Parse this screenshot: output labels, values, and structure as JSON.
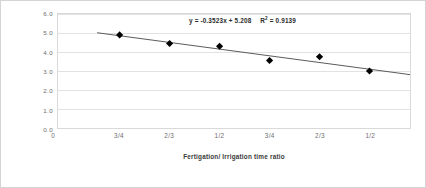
{
  "chart_data": {
    "type": "scatter",
    "title": "",
    "subtitle": "",
    "xlabel": "Fertigation/ Irrigation time ratio",
    "ylabel": "Yield   ton/fed",
    "x": [
      1,
      2,
      3,
      4,
      5,
      6
    ],
    "categories": [
      "3/4",
      "2/3",
      "1/2",
      "3/4",
      "2/3",
      "1/2"
    ],
    "values": [
      4.9,
      4.45,
      4.3,
      3.55,
      3.75,
      3.0
    ],
    "series": [
      {
        "name": "Yield",
        "values": [
          4.9,
          4.45,
          4.3,
          3.55,
          3.75,
          3.0
        ],
        "marker": "diamond",
        "color": "#000000"
      }
    ],
    "trendline": {
      "type": "linear",
      "slope": -0.3523,
      "intercept": 5.208,
      "r_squared": 0.9139,
      "equation_label": "y = -0.3523x + 5.208",
      "r2_label_prefix": "R",
      "r2_label_sup": "2",
      "r2_label_value": " = 0.9139",
      "color": "#595959"
    },
    "ylim": [
      0.0,
      6.0
    ],
    "ytick_step": 1.0,
    "ytick_labels": [
      "6.0",
      "5.0",
      "4.0",
      "3.0",
      "2.0",
      "1.0",
      "0.0"
    ],
    "ytick_values": [
      6.0,
      5.0,
      4.0,
      3.0,
      2.0,
      1.0,
      0.0
    ],
    "xtick_labels": [
      "3/4",
      "2/3",
      "1/2",
      "3/4",
      "2/3",
      "1/2"
    ],
    "x_origin_label": "0",
    "grid": "horizontal",
    "legend": "none",
    "colors": {
      "marker": "#000000",
      "trendline": "#595959",
      "gridline": "#e2e2e2",
      "axis_text": "#6e6e6e",
      "title_text": "#3a3a3a",
      "plot_border": "#d9d9d9",
      "figure_border": "#d4d4d4",
      "background": "#ffffff"
    }
  }
}
